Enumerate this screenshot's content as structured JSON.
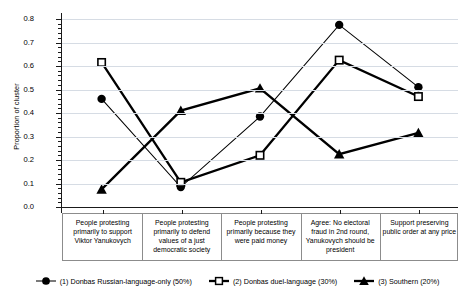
{
  "chart_data": {
    "type": "line",
    "title": "",
    "xlabel": "",
    "ylabel": "Proportion of cluster",
    "ylim": [
      0.0,
      0.8
    ],
    "ytick_labels": [
      "0.0",
      "0.1",
      "0.2",
      "0.3",
      "0.4",
      "0.5",
      "0.6",
      "0.7",
      "0.8"
    ],
    "ytick_values": [
      0.0,
      0.1,
      0.2,
      0.3,
      0.4,
      0.5,
      0.6,
      0.7,
      0.8
    ],
    "grid": true,
    "legend_position": "bottom",
    "categories": [
      "People protesting primarily to support Viktor Yanukovych",
      "People protesting primarily to defend values of a just democratic society",
      "People protesting primarily because they were paid money",
      "Agree: No electoral fraud in 2nd round, Yanukovych should be president",
      "Support preserving public order at any price"
    ],
    "series": [
      {
        "name": "(1) Donbas Russian-language-only (50%)",
        "marker": "filled-circle",
        "values": [
          0.46,
          0.085,
          0.385,
          0.775,
          0.51
        ]
      },
      {
        "name": "(2) Donbas duel-language (30%)",
        "marker": "open-square",
        "values": [
          0.615,
          0.105,
          0.22,
          0.625,
          0.47
        ]
      },
      {
        "name": "(3) Southern (20%)",
        "marker": "filled-triangle",
        "values": [
          0.075,
          0.41,
          0.505,
          0.225,
          0.315
        ]
      }
    ]
  }
}
